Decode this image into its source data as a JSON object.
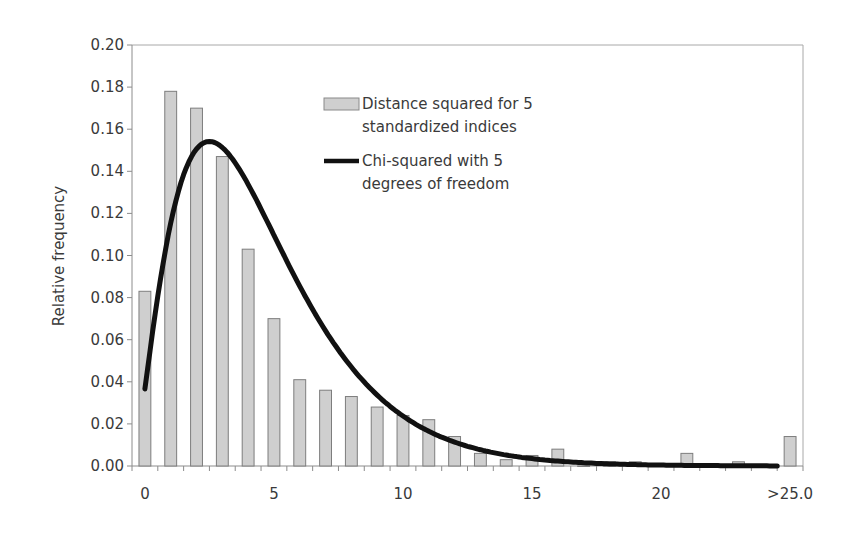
{
  "chart_data": {
    "type": "bar",
    "title": "",
    "xlabel": "",
    "ylabel": "Relative frequency",
    "ylim": [
      0,
      0.2
    ],
    "yticks": [
      "0.00",
      "0.02",
      "0.04",
      "0.06",
      "0.08",
      "0.10",
      "0.12",
      "0.14",
      "0.16",
      "0.18",
      "0.20"
    ],
    "xticks": [
      {
        "index": 0,
        "label": "0"
      },
      {
        "index": 5,
        "label": "5"
      },
      {
        "index": 10,
        "label": "10"
      },
      {
        "index": 15,
        "label": "15"
      },
      {
        "index": 20,
        "label": "20"
      },
      {
        "index": 25,
        "label": ">25.0"
      }
    ],
    "grid": false,
    "legend_position": "upper-center",
    "categories": [
      "0",
      "1",
      "2",
      "3",
      "4",
      "5",
      "6",
      "7",
      "8",
      "9",
      "10",
      "11",
      "12",
      "13",
      "14",
      "15",
      "16",
      "17",
      "18",
      "19",
      "20",
      "21",
      "22",
      "23",
      "24",
      ">25.0"
    ],
    "series": [
      {
        "name": "Distance squared for 5 standardized indices",
        "kind": "bar",
        "color": "#cfcfcf",
        "values": [
          0.083,
          0.178,
          0.17,
          0.147,
          0.103,
          0.07,
          0.041,
          0.036,
          0.033,
          0.028,
          0.024,
          0.022,
          0.014,
          0.006,
          0.003,
          0.005,
          0.008,
          0.0,
          0.002,
          0.002,
          0.001,
          0.006,
          0.001,
          0.002,
          0.0,
          0.014
        ]
      },
      {
        "name": "Chi-squared with 5 degrees of freedom",
        "kind": "line",
        "color": "#111111",
        "degrees_of_freedom": 5,
        "values": [
          0.037,
          0.08,
          0.138,
          0.154,
          0.144,
          0.122,
          0.097,
          0.073,
          0.053,
          0.037,
          0.026,
          0.017,
          0.011,
          0.007,
          0.005,
          0.003,
          0.002,
          0.001,
          0.001,
          0.001,
          0.0,
          0.0,
          0.0,
          0.0,
          0.0,
          0.0
        ]
      }
    ]
  },
  "legend": {
    "items": [
      {
        "line1": "Distance squared for 5",
        "line2": "standardized indices"
      },
      {
        "line1": "Chi-squared with 5",
        "line2": "degrees of freedom"
      }
    ]
  }
}
